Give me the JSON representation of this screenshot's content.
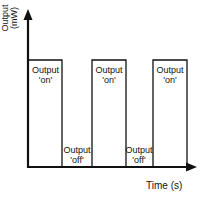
{
  "diagram": {
    "type": "pulse-timing-diagram",
    "y_axis_label_line1": "Output",
    "y_axis_label_line2": "(mW)",
    "x_axis_label": "Time (s)",
    "line_color": "#111111",
    "states": [
      {
        "label_line1": "Output",
        "label_line2": "'on'",
        "state": "on"
      },
      {
        "label_line1": "Output",
        "label_line2": "'off'",
        "state": "off"
      },
      {
        "label_line1": "Output",
        "label_line2": "'on'",
        "state": "on"
      },
      {
        "label_line1": "Output",
        "label_line2": "'off'",
        "state": "off"
      },
      {
        "label_line1": "Output",
        "label_line2": "'on'",
        "state": "on"
      }
    ]
  }
}
